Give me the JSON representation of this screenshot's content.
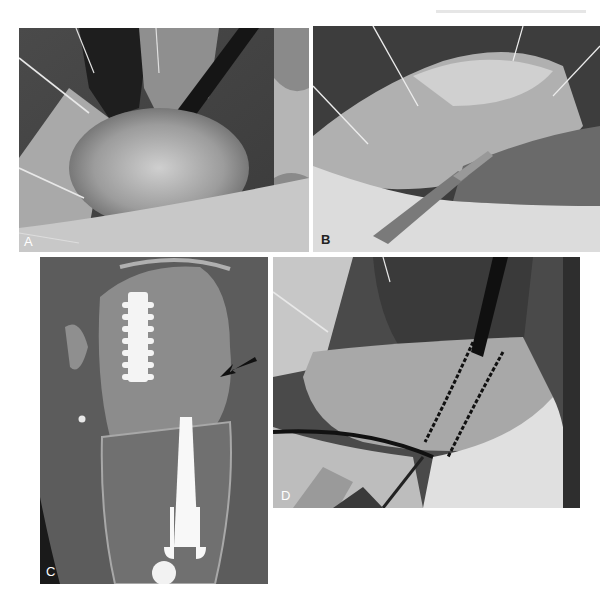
{
  "figure": {
    "panels": [
      {
        "id": "A",
        "label": "A",
        "kind": "intraoperative-photo",
        "label_color": "#ffffff"
      },
      {
        "id": "B",
        "label": "B",
        "kind": "intraoperative-photo",
        "label_color": "#222222"
      },
      {
        "id": "C",
        "label": "C",
        "kind": "ct-scan-coronal",
        "label_color": "#ffffff",
        "annotation": "arrow"
      },
      {
        "id": "D",
        "label": "D",
        "kind": "intraoperative-photo-marked-osteotomy",
        "label_color": "#ffffff"
      }
    ],
    "colors": {
      "background": "#ffffff",
      "photo_dark": "#2a2a2a",
      "photo_mid": "#8a8a8a",
      "photo_light": "#d6d6d6",
      "ct_background": "#5c5c5c",
      "ct_bone": "#9a9a9a",
      "hardware": "#f4f4f4",
      "arrow": "#111111"
    }
  }
}
